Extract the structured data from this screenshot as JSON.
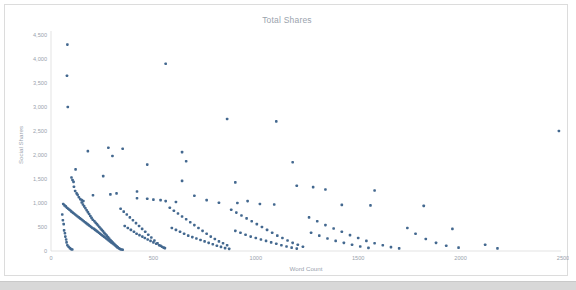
{
  "chart": {
    "title": "Total Shares",
    "x_axis_title": "Word Count",
    "y_axis_title": "Social Shares"
  },
  "chart_data": {
    "type": "scatter",
    "title": "Total Shares",
    "xlabel": "Word Count",
    "ylabel": "Social Shares",
    "xlim": [
      0,
      2500
    ],
    "ylim": [
      0,
      4500
    ],
    "xticks": [
      0,
      500,
      1000,
      1500,
      2000,
      2500
    ],
    "xtick_labels": [
      "0",
      "500",
      "1000",
      "1500",
      "2000",
      "2500"
    ],
    "yticks": [
      0,
      500,
      1000,
      1500,
      2000,
      2500,
      3000,
      3500,
      4000,
      4500
    ],
    "ytick_labels": [
      "0",
      "500",
      "1,000",
      "1,500",
      "2,000",
      "2,500",
      "3,000",
      "3,500",
      "4,000",
      "4,500"
    ],
    "grid": false,
    "legend": false,
    "marker_color": "#43688f",
    "marker_size": 2.6,
    "series": [
      {
        "name": "Articles",
        "points": [
          [
            80,
            4300
          ],
          [
            78,
            3650
          ],
          [
            82,
            3000
          ],
          [
            560,
            3900
          ],
          [
            860,
            2750
          ],
          [
            1100,
            2700
          ],
          [
            2480,
            2500
          ],
          [
            280,
            2150
          ],
          [
            350,
            2130
          ],
          [
            180,
            2080
          ],
          [
            640,
            2060
          ],
          [
            300,
            1980
          ],
          [
            120,
            1700
          ],
          [
            660,
            1870
          ],
          [
            1180,
            1850
          ],
          [
            470,
            1800
          ],
          [
            255,
            1560
          ],
          [
            100,
            1530
          ],
          [
            105,
            1480
          ],
          [
            110,
            1440
          ],
          [
            640,
            1460
          ],
          [
            900,
            1430
          ],
          [
            1200,
            1360
          ],
          [
            1280,
            1330
          ],
          [
            1340,
            1280
          ],
          [
            1580,
            1260
          ],
          [
            420,
            1240
          ],
          [
            320,
            1200
          ],
          [
            290,
            1180
          ],
          [
            205,
            1160
          ],
          [
            112,
            1340
          ],
          [
            118,
            1250
          ],
          [
            125,
            1200
          ],
          [
            130,
            1170
          ],
          [
            136,
            1120
          ],
          [
            143,
            1080
          ],
          [
            150,
            1060
          ],
          [
            158,
            1040
          ],
          [
            420,
            1100
          ],
          [
            470,
            1090
          ],
          [
            500,
            1070
          ],
          [
            535,
            1060
          ],
          [
            560,
            1040
          ],
          [
            610,
            1020
          ],
          [
            700,
            1150
          ],
          [
            760,
            1060
          ],
          [
            820,
            1005
          ],
          [
            910,
            1000
          ],
          [
            960,
            1040
          ],
          [
            1020,
            980
          ],
          [
            1090,
            970
          ],
          [
            1420,
            960
          ],
          [
            1560,
            950
          ],
          [
            1820,
            940
          ],
          [
            60,
            980
          ],
          [
            66,
            950
          ],
          [
            72,
            930
          ],
          [
            78,
            900
          ],
          [
            84,
            880
          ],
          [
            90,
            860
          ],
          [
            96,
            840
          ],
          [
            100,
            820
          ],
          [
            106,
            800
          ],
          [
            112,
            780
          ],
          [
            118,
            760
          ],
          [
            124,
            740
          ],
          [
            130,
            720
          ],
          [
            136,
            700
          ],
          [
            142,
            680
          ],
          [
            148,
            660
          ],
          [
            154,
            640
          ],
          [
            160,
            620
          ],
          [
            166,
            600
          ],
          [
            172,
            580
          ],
          [
            178,
            560
          ],
          [
            184,
            540
          ],
          [
            190,
            520
          ],
          [
            196,
            500
          ],
          [
            202,
            480
          ],
          [
            210,
            460
          ],
          [
            216,
            440
          ],
          [
            222,
            420
          ],
          [
            228,
            400
          ],
          [
            234,
            380
          ],
          [
            240,
            360
          ],
          [
            246,
            340
          ],
          [
            252,
            320
          ],
          [
            258,
            300
          ],
          [
            264,
            280
          ],
          [
            270,
            260
          ],
          [
            276,
            240
          ],
          [
            282,
            220
          ],
          [
            288,
            200
          ],
          [
            294,
            180
          ],
          [
            300,
            160
          ],
          [
            306,
            140
          ],
          [
            312,
            120
          ],
          [
            318,
            100
          ],
          [
            324,
            80
          ],
          [
            55,
            760
          ],
          [
            58,
            640
          ],
          [
            62,
            560
          ],
          [
            64,
            430
          ],
          [
            68,
            370
          ],
          [
            70,
            300
          ],
          [
            74,
            240
          ],
          [
            76,
            180
          ],
          [
            80,
            120
          ],
          [
            86,
            90
          ],
          [
            92,
            60
          ],
          [
            98,
            40
          ],
          [
            104,
            30
          ],
          [
            340,
            880
          ],
          [
            355,
            820
          ],
          [
            370,
            760
          ],
          [
            385,
            700
          ],
          [
            400,
            640
          ],
          [
            415,
            580
          ],
          [
            430,
            520
          ],
          [
            445,
            460
          ],
          [
            460,
            400
          ],
          [
            475,
            340
          ],
          [
            490,
            280
          ],
          [
            505,
            220
          ],
          [
            520,
            160
          ],
          [
            535,
            110
          ],
          [
            550,
            70
          ],
          [
            360,
            520
          ],
          [
            375,
            480
          ],
          [
            390,
            440
          ],
          [
            405,
            400
          ],
          [
            418,
            360
          ],
          [
            432,
            330
          ],
          [
            446,
            300
          ],
          [
            458,
            270
          ],
          [
            472,
            240
          ],
          [
            486,
            210
          ],
          [
            500,
            180
          ],
          [
            514,
            150
          ],
          [
            528,
            120
          ],
          [
            542,
            90
          ],
          [
            556,
            60
          ],
          [
            580,
            900
          ],
          [
            600,
            840
          ],
          [
            620,
            780
          ],
          [
            640,
            720
          ],
          [
            660,
            660
          ],
          [
            680,
            600
          ],
          [
            700,
            540
          ],
          [
            720,
            480
          ],
          [
            740,
            420
          ],
          [
            760,
            360
          ],
          [
            780,
            300
          ],
          [
            800,
            250
          ],
          [
            820,
            200
          ],
          [
            840,
            160
          ],
          [
            860,
            120
          ],
          [
            590,
            480
          ],
          [
            610,
            440
          ],
          [
            630,
            400
          ],
          [
            650,
            360
          ],
          [
            670,
            320
          ],
          [
            690,
            290
          ],
          [
            710,
            260
          ],
          [
            730,
            230
          ],
          [
            750,
            200
          ],
          [
            770,
            170
          ],
          [
            790,
            140
          ],
          [
            810,
            110
          ],
          [
            830,
            85
          ],
          [
            850,
            60
          ],
          [
            870,
            45
          ],
          [
            880,
            860
          ],
          [
            905,
            800
          ],
          [
            930,
            740
          ],
          [
            955,
            680
          ],
          [
            980,
            620
          ],
          [
            1005,
            560
          ],
          [
            1030,
            500
          ],
          [
            1055,
            440
          ],
          [
            1080,
            380
          ],
          [
            1105,
            320
          ],
          [
            1130,
            270
          ],
          [
            1155,
            220
          ],
          [
            1180,
            170
          ],
          [
            1205,
            130
          ],
          [
            1230,
            90
          ],
          [
            900,
            420
          ],
          [
            925,
            380
          ],
          [
            950,
            340
          ],
          [
            975,
            300
          ],
          [
            1000,
            270
          ],
          [
            1025,
            240
          ],
          [
            1050,
            210
          ],
          [
            1075,
            180
          ],
          [
            1100,
            150
          ],
          [
            1125,
            120
          ],
          [
            1150,
            95
          ],
          [
            1175,
            70
          ],
          [
            1200,
            50
          ],
          [
            1260,
            700
          ],
          [
            1300,
            620
          ],
          [
            1340,
            540
          ],
          [
            1380,
            470
          ],
          [
            1420,
            400
          ],
          [
            1460,
            330
          ],
          [
            1500,
            270
          ],
          [
            1540,
            210
          ],
          [
            1580,
            160
          ],
          [
            1620,
            120
          ],
          [
            1660,
            80
          ],
          [
            1700,
            55
          ],
          [
            1270,
            380
          ],
          [
            1310,
            320
          ],
          [
            1350,
            260
          ],
          [
            1390,
            210
          ],
          [
            1430,
            170
          ],
          [
            1470,
            130
          ],
          [
            1510,
            95
          ],
          [
            1550,
            65
          ],
          [
            1740,
            480
          ],
          [
            1780,
            360
          ],
          [
            1830,
            250
          ],
          [
            1880,
            170
          ],
          [
            1930,
            110
          ],
          [
            1960,
            460
          ],
          [
            1990,
            70
          ],
          [
            2120,
            130
          ],
          [
            2180,
            55
          ],
          [
            150,
            1010
          ],
          [
            156,
            970
          ],
          [
            162,
            930
          ],
          [
            168,
            890
          ],
          [
            174,
            850
          ],
          [
            180,
            810
          ],
          [
            186,
            770
          ],
          [
            192,
            730
          ],
          [
            198,
            690
          ],
          [
            204,
            650
          ],
          [
            212,
            620
          ],
          [
            218,
            590
          ],
          [
            224,
            560
          ],
          [
            230,
            530
          ],
          [
            236,
            500
          ],
          [
            242,
            470
          ],
          [
            248,
            440
          ],
          [
            254,
            410
          ],
          [
            260,
            380
          ],
          [
            266,
            350
          ],
          [
            272,
            320
          ],
          [
            278,
            290
          ],
          [
            284,
            260
          ],
          [
            290,
            230
          ],
          [
            296,
            200
          ],
          [
            302,
            175
          ],
          [
            308,
            150
          ],
          [
            314,
            125
          ],
          [
            320,
            100
          ],
          [
            326,
            75
          ],
          [
            332,
            55
          ],
          [
            338,
            40
          ],
          [
            344,
            30
          ],
          [
            350,
            25
          ]
        ]
      }
    ]
  }
}
